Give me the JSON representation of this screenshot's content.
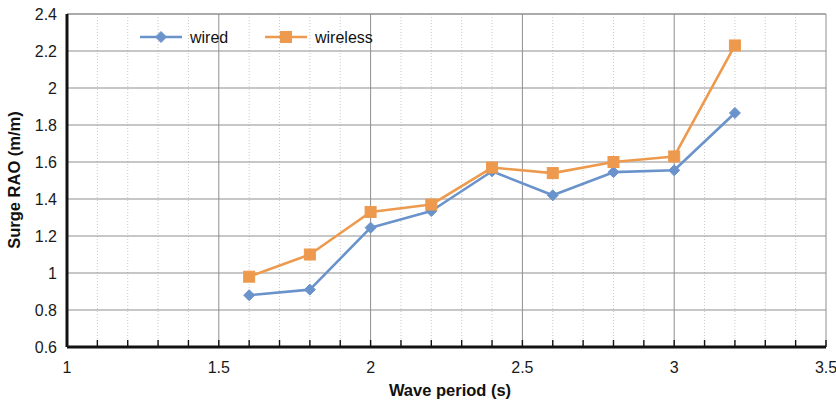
{
  "chart_data": {
    "type": "line",
    "title": "",
    "xlabel": "Wave period (s)",
    "ylabel": "Surge RAO (m/m)",
    "xlim": [
      1,
      3.5
    ],
    "ylim": [
      0.6,
      2.4
    ],
    "xticks": [
      "1",
      "1.5",
      "2",
      "2.5",
      "3",
      "3.5"
    ],
    "xtick_values": [
      1,
      1.5,
      2,
      2.5,
      3,
      3.5
    ],
    "yticks": [
      "0.6",
      "0.8",
      "1",
      "1.2",
      "1.4",
      "1.6",
      "1.8",
      "2",
      "2.2",
      "2.4"
    ],
    "ytick_values": [
      0.6,
      0.8,
      1.0,
      1.2,
      1.4,
      1.6,
      1.8,
      2.0,
      2.2,
      2.4
    ],
    "grid": true,
    "grid_major_x_step": 0.5,
    "grid_minor_x_step": 0.1,
    "grid_major_y_step": 0.2,
    "legend_position": "top-center",
    "x": [
      1.6,
      1.8,
      2.0,
      2.2,
      2.4,
      2.6,
      2.8,
      3.0,
      3.2
    ],
    "series": [
      {
        "name": "wired",
        "color": "#6A93CB",
        "marker": "diamond",
        "values": [
          0.88,
          0.91,
          1.245,
          1.335,
          1.55,
          1.42,
          1.545,
          1.555,
          1.865
        ]
      },
      {
        "name": "wireless",
        "color": "#ED9A4E",
        "marker": "square",
        "values": [
          0.98,
          1.1,
          1.33,
          1.37,
          1.57,
          1.54,
          1.6,
          1.63,
          2.23
        ]
      }
    ]
  },
  "legend": {
    "items": [
      {
        "label": "wired"
      },
      {
        "label": "wireless"
      }
    ]
  },
  "colors": {
    "wired": "#6A93CB",
    "wireless": "#ED9A4E",
    "axis": "#121212",
    "grid_major": "#8f8f8f",
    "grid_minor": "#c9c9c9",
    "background": "#ffffff"
  }
}
